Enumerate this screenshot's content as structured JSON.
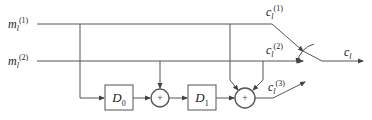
{
  "diagram": {
    "type": "convolutional-encoder-block-diagram",
    "inputs": [
      {
        "id": "m1",
        "label": "m",
        "sub": "l",
        "sup": "(1)"
      },
      {
        "id": "m2",
        "label": "m",
        "sub": "l",
        "sup": "(2)"
      }
    ],
    "delays": [
      {
        "id": "D0",
        "label": "D",
        "sub": "0"
      },
      {
        "id": "D1",
        "label": "D",
        "sub": "1"
      }
    ],
    "adders": [
      {
        "id": "adder1",
        "symbol": "+"
      },
      {
        "id": "adder2",
        "symbol": "+"
      }
    ],
    "outputs": [
      {
        "id": "c1",
        "label": "c",
        "sub": "l",
        "sup": "(1)"
      },
      {
        "id": "c2",
        "label": "c",
        "sub": "l",
        "sup": "(2)"
      },
      {
        "id": "c3",
        "label": "c",
        "sub": "l",
        "sup": "(3)"
      }
    ],
    "multiplexed_output": {
      "label": "c",
      "sub": "l"
    },
    "colors": {
      "line": "#555555",
      "text": "#222222",
      "background": "#ffffff"
    }
  }
}
